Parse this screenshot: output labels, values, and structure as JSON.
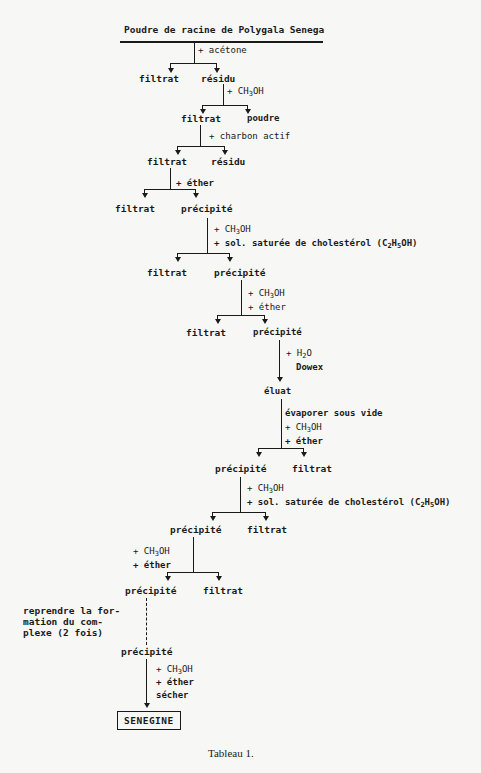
{
  "title": "Poudre de racine de Polygala Senega",
  "steps": {
    "s1_reagent": "+ acétone",
    "s1_left": "filtrat",
    "s1_right": "résidu",
    "s2_reagent_pre": "+ CH",
    "s2_reagent_sub": "3",
    "s2_reagent_post": "OH",
    "s2_left": "filtrat",
    "s2_right": "poudre",
    "s3_reagent": "+ charbon actif",
    "s3_left": "filtrat",
    "s3_right": "résidu",
    "s4_reagent": "+ éther",
    "s4_left": "filtrat",
    "s4_right": "précipité",
    "s5_reagent1_pre": "+ CH",
    "s5_reagent1_sub": "3",
    "s5_reagent1_post": "OH",
    "s5_reagent2_pre": "+ sol. saturée de cholestérol (C",
    "s5_reagent2_sub1": "2",
    "s5_reagent2_mid": "H",
    "s5_reagent2_sub2": "5",
    "s5_reagent2_post": "OH)",
    "s5_left": "filtrat",
    "s5_right": "précipité",
    "s6_reagent1_pre": "+ CH",
    "s6_reagent1_sub": "3",
    "s6_reagent1_post": "OH",
    "s6_reagent2": "+ éther",
    "s6_left": "filtrat",
    "s6_right": "précipité",
    "s7_reagent1_pre": "+ H",
    "s7_reagent1_sub": "2",
    "s7_reagent1_post": "O",
    "s7_reagent2": "Dowex",
    "s7_result": "éluat",
    "s8_reagent1": "évaporer sous vide",
    "s8_reagent2_pre": "+ CH",
    "s8_reagent2_sub": "3",
    "s8_reagent2_post": "OH",
    "s8_reagent3": "+ éther",
    "s8_left": "précipité",
    "s8_right": "filtrat",
    "s9_reagent1_pre": "+ CH",
    "s9_reagent1_sub": "3",
    "s9_reagent1_post": "OH",
    "s9_reagent2_pre": "+ sol. saturée de cholestérol (C",
    "s9_reagent2_sub1": "2",
    "s9_reagent2_mid": "H",
    "s9_reagent2_sub2": "5",
    "s9_reagent2_post": "OH)",
    "s9_left": "précipité",
    "s9_right": "filtrat",
    "s10_reagent1_pre": "+ CH",
    "s10_reagent1_sub": "3",
    "s10_reagent1_post": "OH",
    "s10_reagent2": "+ éther",
    "s10_left": "précipité",
    "s10_right": "filtrat",
    "repeat_note_1": "reprendre la for-",
    "repeat_note_2": "mation du com-",
    "repeat_note_3": "plexe (2 fois)",
    "s11_result": "précipité",
    "s12_reagent1_pre": "+ CH",
    "s12_reagent1_sub": "3",
    "s12_reagent1_post": "OH",
    "s12_reagent2": "+ éther",
    "s12_reagent3": "sécher",
    "final": "SENEGINE"
  },
  "caption": "Tableau 1."
}
